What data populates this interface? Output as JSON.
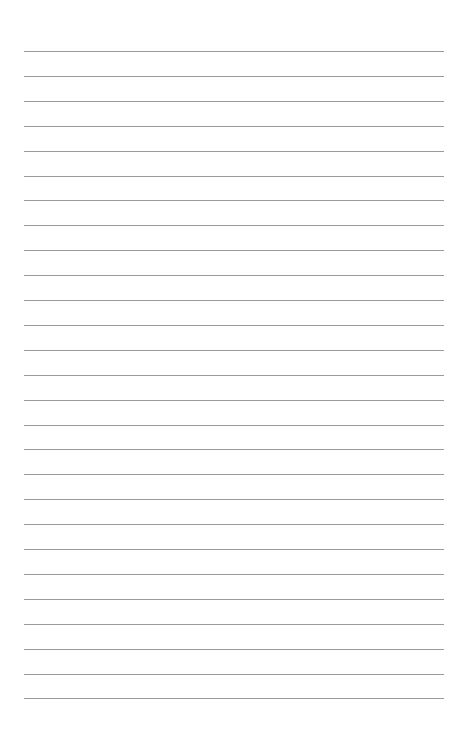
{
  "page": {
    "type": "lined-paper",
    "background_color": "#ffffff",
    "line_color": "#9a9a9a",
    "line_count": 27,
    "first_line_y": 51,
    "line_spacing": 24.9,
    "line_left": 24,
    "line_width": 420
  }
}
